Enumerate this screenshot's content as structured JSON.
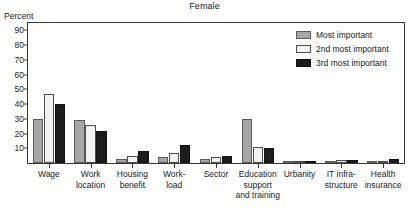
{
  "chart_data": {
    "type": "bar",
    "title": "Female",
    "xlabel": "",
    "ylabel": "Percent",
    "ylim": [
      0,
      95
    ],
    "yticks": [
      10,
      20,
      30,
      40,
      50,
      60,
      70,
      80,
      90
    ],
    "grid": false,
    "legend_position": "top-right",
    "categories": [
      "Wage",
      "Work location",
      "Housing benefit",
      "Work-load",
      "Sector",
      "Education support and training",
      "Urbanity",
      "IT infra-structure",
      "Health insurance"
    ],
    "category_lines": [
      [
        "Wage"
      ],
      [
        "Work",
        "location"
      ],
      [
        "Housing",
        "benefit"
      ],
      [
        "Work-",
        "load"
      ],
      [
        "Sector"
      ],
      [
        "Education",
        "support",
        "and training"
      ],
      [
        "Urbanity"
      ],
      [
        "IT infra-",
        "structure"
      ],
      [
        "Health",
        "insurance"
      ]
    ],
    "series": [
      {
        "name": "Most important",
        "color": "#a6a6a6",
        "values": [
          30,
          29,
          3,
          4,
          3,
          30,
          1,
          1,
          1
        ]
      },
      {
        "name": "2nd most important",
        "color": "#f2f2f2",
        "values": [
          47,
          26,
          5,
          7,
          4,
          11,
          1,
          2,
          1
        ]
      },
      {
        "name": "3rd most important",
        "color": "#1c1c1c",
        "values": [
          40,
          22,
          8,
          12,
          5,
          10,
          1,
          2,
          3
        ]
      }
    ]
  },
  "legend": {
    "items": [
      {
        "label": "Most important"
      },
      {
        "label": "2nd most important"
      },
      {
        "label": "3rd most important"
      }
    ]
  }
}
